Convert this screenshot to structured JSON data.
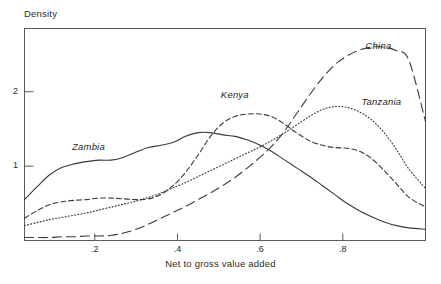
{
  "chart_data": {
    "type": "line",
    "title": "",
    "xlabel": "Net to gross value added",
    "ylabel": "Density",
    "xlim": [
      0.03,
      1.0
    ],
    "ylim": [
      0,
      2.85
    ],
    "grid": false,
    "legend_position": "inline-annotations",
    "xticks": [
      0.2,
      0.4,
      0.6,
      0.8
    ],
    "xtick_labels": [
      ".2",
      ".4",
      ".6",
      ".8"
    ],
    "yticks": [
      1,
      2
    ],
    "ytick_labels": [
      "1",
      "2"
    ],
    "series": [
      {
        "name": "Zambia",
        "style": "solid",
        "label_x": 0.145,
        "label_y": 1.26,
        "x": [
          0.03,
          0.06,
          0.09,
          0.12,
          0.15,
          0.18,
          0.21,
          0.24,
          0.27,
          0.3,
          0.33,
          0.36,
          0.39,
          0.42,
          0.45,
          0.48,
          0.51,
          0.54,
          0.57,
          0.6,
          0.63,
          0.66,
          0.69,
          0.72,
          0.75,
          0.78,
          0.81,
          0.84,
          0.87,
          0.9,
          0.93,
          0.96,
          1.0
        ],
        "y": [
          0.55,
          0.72,
          0.88,
          0.98,
          1.03,
          1.06,
          1.08,
          1.08,
          1.12,
          1.19,
          1.25,
          1.28,
          1.32,
          1.4,
          1.45,
          1.45,
          1.42,
          1.4,
          1.35,
          1.28,
          1.19,
          1.08,
          0.97,
          0.86,
          0.74,
          0.62,
          0.5,
          0.4,
          0.32,
          0.25,
          0.2,
          0.17,
          0.15
        ]
      },
      {
        "name": "Kenya",
        "style": "short-dash",
        "label_x": 0.505,
        "label_y": 1.95,
        "x": [
          0.03,
          0.06,
          0.09,
          0.12,
          0.15,
          0.18,
          0.21,
          0.24,
          0.27,
          0.3,
          0.33,
          0.36,
          0.39,
          0.42,
          0.45,
          0.48,
          0.51,
          0.54,
          0.57,
          0.6,
          0.63,
          0.66,
          0.69,
          0.72,
          0.75,
          0.78,
          0.81,
          0.84,
          0.87,
          0.9,
          0.93,
          0.96,
          1.0
        ],
        "y": [
          0.3,
          0.4,
          0.48,
          0.52,
          0.54,
          0.55,
          0.57,
          0.57,
          0.56,
          0.55,
          0.56,
          0.62,
          0.74,
          0.92,
          1.15,
          1.4,
          1.58,
          1.67,
          1.7,
          1.7,
          1.66,
          1.56,
          1.44,
          1.34,
          1.28,
          1.25,
          1.24,
          1.2,
          1.1,
          0.94,
          0.76,
          0.58,
          0.45
        ]
      },
      {
        "name": "Tanzania",
        "style": "dotted",
        "label_x": 0.845,
        "label_y": 1.86,
        "x": [
          0.03,
          0.06,
          0.09,
          0.12,
          0.15,
          0.18,
          0.21,
          0.24,
          0.27,
          0.3,
          0.33,
          0.36,
          0.39,
          0.42,
          0.45,
          0.48,
          0.51,
          0.54,
          0.57,
          0.6,
          0.63,
          0.66,
          0.69,
          0.72,
          0.75,
          0.78,
          0.81,
          0.84,
          0.87,
          0.9,
          0.93,
          0.96,
          1.0
        ],
        "y": [
          0.2,
          0.24,
          0.28,
          0.31,
          0.34,
          0.37,
          0.41,
          0.45,
          0.49,
          0.53,
          0.58,
          0.64,
          0.71,
          0.78,
          0.86,
          0.94,
          1.02,
          1.1,
          1.18,
          1.26,
          1.35,
          1.45,
          1.56,
          1.67,
          1.76,
          1.8,
          1.79,
          1.73,
          1.62,
          1.45,
          1.22,
          0.96,
          0.7
        ]
      },
      {
        "name": "China",
        "style": "long-dash",
        "label_x": 0.855,
        "label_y": 2.62,
        "x": [
          0.03,
          0.06,
          0.09,
          0.12,
          0.15,
          0.18,
          0.21,
          0.24,
          0.27,
          0.3,
          0.33,
          0.36,
          0.39,
          0.42,
          0.45,
          0.48,
          0.51,
          0.54,
          0.57,
          0.6,
          0.63,
          0.66,
          0.69,
          0.72,
          0.75,
          0.78,
          0.81,
          0.84,
          0.87,
          0.9,
          0.93,
          0.96,
          1.0
        ],
        "y": [
          0.04,
          0.04,
          0.04,
          0.05,
          0.05,
          0.06,
          0.06,
          0.07,
          0.1,
          0.15,
          0.22,
          0.3,
          0.38,
          0.46,
          0.55,
          0.64,
          0.74,
          0.85,
          0.98,
          1.12,
          1.28,
          1.48,
          1.72,
          1.96,
          2.18,
          2.36,
          2.48,
          2.56,
          2.6,
          2.6,
          2.55,
          2.42,
          1.6
        ]
      }
    ]
  }
}
